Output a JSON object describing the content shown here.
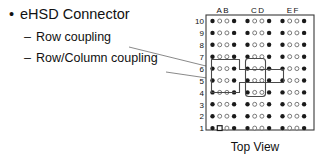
{
  "slide": {
    "title": "eHSD Connector",
    "bullet_marker": "•",
    "sub_marker": "–",
    "sub_bullets": [
      {
        "label": "Row coupling"
      },
      {
        "label": "Row/Column coupling"
      }
    ]
  },
  "connector": {
    "caption": "Top View",
    "column_labels": [
      "AB",
      "CD",
      "EF"
    ],
    "row_labels": [
      "10",
      "9",
      "8",
      "7",
      "6",
      "5",
      "4",
      "3",
      "2",
      "1"
    ],
    "columns_per_group": 4,
    "group_count": 3,
    "rows": 10,
    "pin_pattern": [
      "filled",
      "open",
      "open",
      "filled"
    ],
    "pin1_marker": "square",
    "pin1_row": "1",
    "pin1_column_index": 1,
    "colors": {
      "body_outline": "#3a3a3a",
      "body_fill": "#ffffff",
      "pin_filled": "#1a1a1a",
      "pin_open_outline": "#6b6b6b",
      "highlight_outline": "#4a4a4a",
      "leader_line": "#6b6b6b",
      "text": "#111111"
    },
    "highlights": [
      {
        "name": "row-coupling-highlight",
        "shape": "z-outline",
        "spans": "rows 5-6, columns A-D"
      },
      {
        "name": "row-column-coupling-highlight",
        "shape": "rect-outline",
        "spans": "rows 4-6, columns C-D"
      }
    ]
  }
}
